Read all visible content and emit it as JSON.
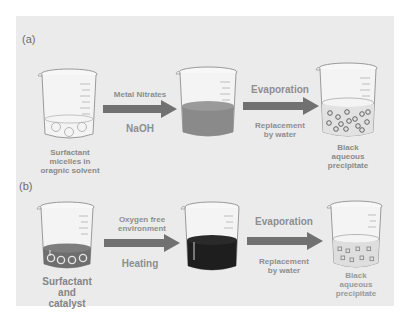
{
  "figure": {
    "background_color": "#ebebeb",
    "rows": [
      {
        "label": "(a)",
        "beakers": [
          {
            "caption": [
              "Surfactant",
              "micelles in",
              "oragnic solvent"
            ],
            "contents": "clear liquid with micelles"
          },
          {
            "caption": [],
            "contents": "gray solution",
            "fill_color": "#8a8a8a"
          },
          {
            "caption": [
              "Black",
              "aqueous",
              "precipitate"
            ],
            "contents": "clear liquid with particles"
          }
        ],
        "steps": [
          {
            "above": "Metal Nitrates",
            "below": "NaOH"
          },
          {
            "above": "Evaporation",
            "below": "Replacement by water",
            "below_lines": [
              "Replacement",
              "by water"
            ]
          }
        ]
      },
      {
        "label": "(b)",
        "beakers": [
          {
            "caption": [
              "Surfactant",
              "and",
              "catalyst"
            ],
            "contents": "dark layer with micelles",
            "fill_color": "#6e6e6e"
          },
          {
            "caption": [],
            "contents": "black solution",
            "fill_color": "#1e1e1e"
          },
          {
            "caption": [
              "Black",
              "aqueous",
              "precipitate"
            ],
            "contents": "clear liquid with particles"
          }
        ],
        "steps": [
          {
            "above": "Oxygen free environment",
            "above_lines": [
              "Oxygen free",
              "environment"
            ],
            "below": "Heating"
          },
          {
            "above": "Evaporation",
            "below": "Replacement by water",
            "below_lines": [
              "Replacement",
              "by water"
            ]
          }
        ]
      }
    ],
    "arrow_color": "#707070"
  }
}
